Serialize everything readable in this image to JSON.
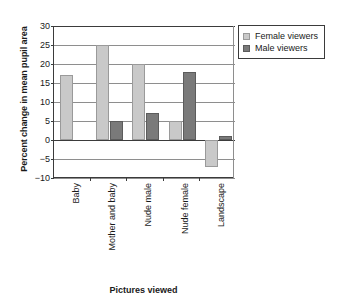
{
  "chart_data": {
    "type": "bar",
    "title": "",
    "xlabel": "Pictures viewed",
    "ylabel": "Percent change in mean pupil area",
    "categories": [
      "Baby",
      "Mother and baby",
      "Nude male",
      "Nude female",
      "Landscape"
    ],
    "series": [
      {
        "name": "Female viewers",
        "color": "#c9c9c9",
        "values": [
          17,
          25,
          20,
          5,
          -7
        ]
      },
      {
        "name": "Male viewers",
        "color": "#7a7a7a",
        "values": [
          null,
          5,
          7,
          18,
          1
        ]
      }
    ],
    "ylim": [
      -10,
      30
    ],
    "ytick_step": 5,
    "ytick_labels": [
      "30",
      "25",
      "20",
      "15",
      "10",
      "5",
      "0",
      "−5",
      "−10"
    ],
    "ytick_values": [
      30,
      25,
      20,
      15,
      10,
      5,
      0,
      -5,
      -10
    ],
    "grid": "horizontal",
    "legend_position": "top-right",
    "legend_entries": [
      "Female viewers",
      "Male viewers"
    ]
  }
}
